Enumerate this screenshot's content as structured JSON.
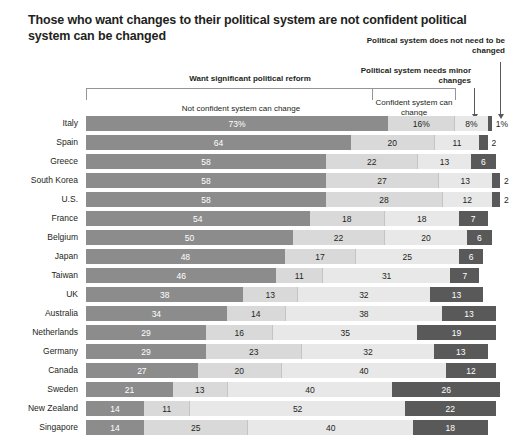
{
  "title": "Those who want changes to their political system are not confident political system can be changed",
  "annotations": {
    "reform_bracket": "Want significant political reform",
    "minor_changes": "Political system needs minor changes",
    "no_change": "Political system does not need to be changed",
    "not_confident": "Not confident system can change",
    "confident": "Confident system can change"
  },
  "colors": {
    "not_confident": "#8c8c8c",
    "confident": "#d9d9d9",
    "minor_changes": "#e8e8e8",
    "no_change": "#595959"
  },
  "chart_data": {
    "type": "bar",
    "subtype": "stacked-horizontal-100",
    "title": "Those who want changes to their political system are not confident political system can be changed",
    "xlabel": "",
    "ylabel": "",
    "xlim": [
      0,
      100
    ],
    "grid": false,
    "legend_position": "top",
    "series": [
      {
        "name": "Not confident system can change",
        "color": "#8c8c8c",
        "values": [
          73,
          64,
          58,
          58,
          58,
          54,
          50,
          48,
          46,
          38,
          34,
          29,
          29,
          27,
          21,
          14,
          14
        ]
      },
      {
        "name": "Confident system can change",
        "color": "#d9d9d9",
        "values": [
          16,
          20,
          22,
          27,
          28,
          18,
          22,
          17,
          11,
          13,
          14,
          16,
          23,
          20,
          13,
          11,
          25
        ]
      },
      {
        "name": "Political system needs minor changes",
        "color": "#e8e8e8",
        "values": [
          8,
          11,
          13,
          13,
          12,
          18,
          20,
          25,
          31,
          32,
          38,
          35,
          32,
          40,
          40,
          52,
          40
        ]
      },
      {
        "name": "Political system does not need to be changed",
        "color": "#595959",
        "values": [
          1,
          2,
          6,
          2,
          2,
          7,
          6,
          6,
          7,
          13,
          13,
          19,
          13,
          12,
          26,
          22,
          18
        ]
      }
    ],
    "categories": [
      "Italy",
      "Spain",
      "Greece",
      "South Korea",
      "U.S.",
      "France",
      "Belgium",
      "Japan",
      "Taiwan",
      "UK",
      "Australia",
      "Netherlands",
      "Germany",
      "Canada",
      "Sweden",
      "New Zealand",
      "Singapore"
    ],
    "rows": [
      {
        "country": "Italy",
        "values": [
          73,
          16,
          8,
          1
        ],
        "labels": [
          "73%",
          "16%",
          "8%",
          "1%"
        ],
        "outside": [
          false,
          false,
          false,
          true
        ]
      },
      {
        "country": "Spain",
        "values": [
          64,
          20,
          11,
          2
        ],
        "labels": [
          "64",
          "20",
          "11",
          "2"
        ],
        "outside": [
          false,
          false,
          false,
          true
        ]
      },
      {
        "country": "Greece",
        "values": [
          58,
          22,
          13,
          6
        ],
        "labels": [
          "58",
          "22",
          "13",
          "6"
        ],
        "outside": [
          false,
          false,
          false,
          false
        ]
      },
      {
        "country": "South Korea",
        "values": [
          58,
          27,
          13,
          2
        ],
        "labels": [
          "58",
          "27",
          "13",
          "2"
        ],
        "outside": [
          false,
          false,
          false,
          true
        ]
      },
      {
        "country": "U.S.",
        "values": [
          58,
          28,
          12,
          2
        ],
        "labels": [
          "58",
          "28",
          "12",
          "2"
        ],
        "outside": [
          false,
          false,
          false,
          true
        ]
      },
      {
        "country": "France",
        "values": [
          54,
          18,
          18,
          7
        ],
        "labels": [
          "54",
          "18",
          "18",
          "7"
        ],
        "outside": [
          false,
          false,
          false,
          false
        ]
      },
      {
        "country": "Belgium",
        "values": [
          50,
          22,
          20,
          6
        ],
        "labels": [
          "50",
          "22",
          "20",
          "6"
        ],
        "outside": [
          false,
          false,
          false,
          false
        ]
      },
      {
        "country": "Japan",
        "values": [
          48,
          17,
          25,
          6
        ],
        "labels": [
          "48",
          "17",
          "25",
          "6"
        ],
        "outside": [
          false,
          false,
          false,
          false
        ]
      },
      {
        "country": "Taiwan",
        "values": [
          46,
          11,
          31,
          7
        ],
        "labels": [
          "46",
          "11",
          "31",
          "7"
        ],
        "outside": [
          false,
          false,
          false,
          false
        ]
      },
      {
        "country": "UK",
        "values": [
          38,
          13,
          32,
          13
        ],
        "labels": [
          "38",
          "13",
          "32",
          "13"
        ],
        "outside": [
          false,
          false,
          false,
          false
        ]
      },
      {
        "country": "Australia",
        "values": [
          34,
          14,
          38,
          13
        ],
        "labels": [
          "34",
          "14",
          "38",
          "13"
        ],
        "outside": [
          false,
          false,
          false,
          false
        ]
      },
      {
        "country": "Netherlands",
        "values": [
          29,
          16,
          35,
          19
        ],
        "labels": [
          "29",
          "16",
          "35",
          "19"
        ],
        "outside": [
          false,
          false,
          false,
          false
        ]
      },
      {
        "country": "Germany",
        "values": [
          29,
          23,
          32,
          13
        ],
        "labels": [
          "29",
          "23",
          "32",
          "13"
        ],
        "outside": [
          false,
          false,
          false,
          false
        ]
      },
      {
        "country": "Canada",
        "values": [
          27,
          20,
          40,
          12
        ],
        "labels": [
          "27",
          "20",
          "40",
          "12"
        ],
        "outside": [
          false,
          false,
          false,
          false
        ]
      },
      {
        "country": "Sweden",
        "values": [
          21,
          13,
          40,
          26
        ],
        "labels": [
          "21",
          "13",
          "40",
          "26"
        ],
        "outside": [
          false,
          false,
          false,
          false
        ]
      },
      {
        "country": "New Zealand",
        "values": [
          14,
          11,
          52,
          22
        ],
        "labels": [
          "14",
          "11",
          "52",
          "22"
        ],
        "outside": [
          false,
          false,
          false,
          false
        ]
      },
      {
        "country": "Singapore",
        "values": [
          14,
          25,
          40,
          18
        ],
        "labels": [
          "14",
          "25",
          "40",
          "18"
        ],
        "outside": [
          false,
          false,
          false,
          false
        ]
      }
    ]
  }
}
